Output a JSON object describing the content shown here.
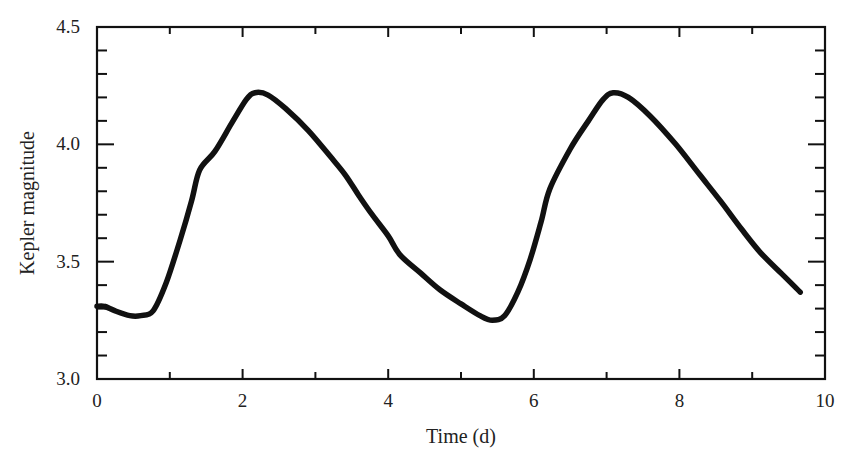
{
  "chart_data": {
    "type": "line",
    "title": "",
    "xlabel": "Time (d)",
    "ylabel": "Kepler magnitude",
    "xlim": [
      0,
      10
    ],
    "ylim": [
      3.0,
      4.5
    ],
    "x_major_ticks": [
      0,
      2,
      4,
      6,
      8,
      10
    ],
    "x_tick_labels": [
      "0",
      "2",
      "4",
      "6",
      "8",
      "10"
    ],
    "x_minor_ticks": [
      1,
      3,
      5,
      7,
      9
    ],
    "y_major_ticks": [
      3.0,
      3.5,
      4.0,
      4.5
    ],
    "y_tick_labels": [
      "3.0",
      "3.5",
      "4.0",
      "4.5"
    ],
    "y_minor_step": 0.1,
    "grid": false,
    "legend": null,
    "line_color": "#111111",
    "series": [
      {
        "name": "Kepler light curve",
        "x": [
          0.0,
          0.1,
          0.25,
          0.45,
          0.6,
          0.77,
          0.95,
          1.14,
          1.3,
          1.41,
          1.62,
          1.85,
          2.05,
          2.17,
          2.35,
          2.6,
          2.9,
          3.2,
          3.41,
          3.6,
          3.78,
          4.0,
          4.16,
          4.45,
          4.71,
          5.0,
          5.26,
          5.43,
          5.6,
          5.78,
          5.95,
          6.1,
          6.22,
          6.5,
          6.75,
          6.95,
          7.09,
          7.3,
          7.6,
          7.95,
          8.28,
          8.56,
          8.85,
          9.11,
          9.4,
          9.66
        ],
        "y": [
          3.31,
          3.31,
          3.29,
          3.27,
          3.27,
          3.29,
          3.41,
          3.59,
          3.76,
          3.89,
          3.97,
          4.09,
          4.19,
          4.22,
          4.21,
          4.15,
          4.06,
          3.95,
          3.87,
          3.78,
          3.7,
          3.61,
          3.53,
          3.45,
          3.38,
          3.32,
          3.27,
          3.25,
          3.27,
          3.37,
          3.51,
          3.67,
          3.81,
          3.98,
          4.1,
          4.19,
          4.22,
          4.2,
          4.12,
          4.0,
          3.87,
          3.76,
          3.64,
          3.54,
          3.45,
          3.37
        ]
      }
    ]
  },
  "axes": {
    "xlabel": "Time (d)",
    "ylabel": "Kepler magnitude"
  }
}
